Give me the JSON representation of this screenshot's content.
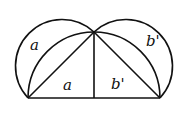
{
  "diagram": {
    "labels": {
      "outer_left": "a",
      "inner_left": "a",
      "inner_right": "b'",
      "outer_right": "b'"
    },
    "points": {
      "base_left": [
        28,
        98
      ],
      "apex": [
        94,
        32
      ],
      "foot": [
        94,
        98
      ],
      "base_right": [
        160,
        98
      ]
    },
    "stroke_color": "#111111"
  }
}
